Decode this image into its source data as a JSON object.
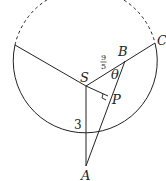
{
  "diagram": {
    "type": "geometry",
    "circle": {
      "cx": 86,
      "cy": 96,
      "r": 72
    },
    "points": {
      "S": {
        "label": "S",
        "x": 86,
        "y": 86
      },
      "A": {
        "label": "A",
        "x": 86,
        "y": 166
      },
      "B": {
        "label": "B",
        "x": 125,
        "y": 61
      },
      "C": {
        "label": "C",
        "x": 155,
        "y": 43
      },
      "P": {
        "label": "P",
        "x": 108,
        "y": 96
      },
      "L": {
        "x": 15,
        "y": 45
      }
    },
    "labels": {
      "S": "S",
      "A": "A",
      "B": "B",
      "C": "C",
      "P": "P",
      "theta": "θ",
      "SA_length": "3",
      "SB_num": "9",
      "SB_den": "5"
    },
    "segments": [
      {
        "from": "L",
        "to": "S"
      },
      {
        "from": "S",
        "to": "C"
      },
      {
        "from": "S",
        "to": "A"
      },
      {
        "from": "A",
        "to": "B"
      },
      {
        "from": "S",
        "to": "P"
      }
    ],
    "right_angle_at": "P",
    "dashed_arc": "upper arc between L and C",
    "colors": {
      "stroke": "#222222",
      "background": "#ffffff"
    }
  }
}
